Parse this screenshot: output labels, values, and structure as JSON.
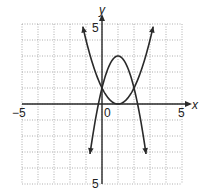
{
  "chart_data": {
    "type": "line",
    "title": "",
    "xlabel": "x",
    "ylabel": "y",
    "xlim": [
      -5,
      5
    ],
    "ylim": [
      -5,
      5
    ],
    "grid": true,
    "tick_labels": {
      "x_min": "−5",
      "x_max": "5",
      "origin": "0",
      "y_max": "5",
      "y_min": "5"
    },
    "series": [
      {
        "name": "upward parabola",
        "equation": "y = (x - 1)^2",
        "vertex": [
          1,
          0
        ],
        "points": [
          [
            -1.2,
            4.84
          ],
          [
            -1,
            4
          ],
          [
            0,
            1
          ],
          [
            1,
            0
          ],
          [
            2,
            1
          ],
          [
            3,
            4
          ],
          [
            3.2,
            4.84
          ]
        ]
      },
      {
        "name": "downward parabola",
        "equation": "y = -2(x - 1)^2 + 3",
        "vertex": [
          1,
          3
        ],
        "points": [
          [
            -0.79,
            -3.4
          ],
          [
            -0.7,
            -2.78
          ],
          [
            0,
            1
          ],
          [
            1,
            3
          ],
          [
            2,
            1
          ],
          [
            2.7,
            -2.78
          ],
          [
            2.85,
            -3.85
          ]
        ]
      }
    ],
    "intersections": [
      [
        0,
        1
      ],
      [
        2,
        1
      ]
    ]
  },
  "colors": {
    "curve": "#2a2a2a",
    "grid": "#9a9a9a",
    "axis": "#2a2a2a"
  }
}
